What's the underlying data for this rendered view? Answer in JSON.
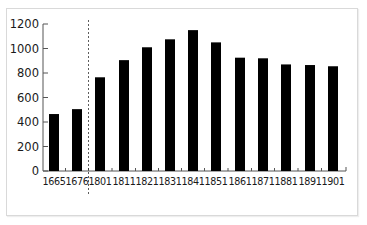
{
  "chart_data": {
    "type": "bar",
    "title": "",
    "xlabel": "",
    "ylabel": "",
    "categories": [
      "1665",
      "1676",
      "1801",
      "1811",
      "1821",
      "1831",
      "1841",
      "1851",
      "1861",
      "1871",
      "1881",
      "1891",
      "1901"
    ],
    "values": [
      465,
      505,
      765,
      905,
      1010,
      1075,
      1150,
      1050,
      925,
      920,
      870,
      865,
      855
    ],
    "ylim": [
      0,
      1200
    ],
    "yticks": [
      0,
      200,
      400,
      600,
      800,
      1000,
      1200
    ],
    "grid": false,
    "legend": null,
    "bar_color": "#000000",
    "annotations": [
      {
        "type": "dashed-vertical-line",
        "between": [
          "1676",
          "1801"
        ],
        "note": "break separating 17th-century and 19th-century data"
      }
    ]
  }
}
